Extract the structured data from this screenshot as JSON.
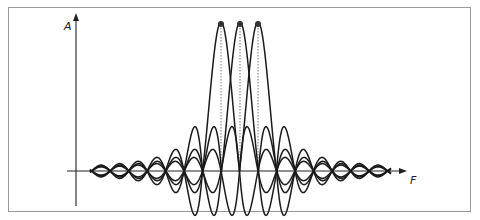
{
  "diagram": {
    "type": "overlapping sinc spectra",
    "y_axis_label": "A",
    "x_axis_label": "F",
    "num_carriers": 3,
    "carrier_peak_x": [
      221,
      240,
      258
    ],
    "baseline_y": 171,
    "peak_y": 22,
    "zero_spacing_px": 18.5,
    "curve_x_range": [
      90,
      391
    ],
    "colors": {
      "curve": "#1a1a1a",
      "axis": "#222222",
      "frame": "#9a9a9a",
      "dotted": "#555555",
      "peak_marker": "#333333"
    }
  }
}
